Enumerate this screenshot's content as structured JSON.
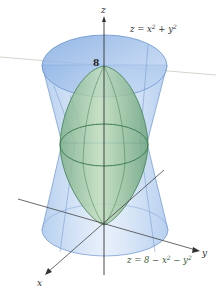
{
  "figure": {
    "colors": {
      "upper_surface_fill": "#a9c8ef",
      "upper_surface_stroke": "#5b86c5",
      "lower_surface_fill": "#8fbf8f",
      "lower_surface_stroke": "#3f7f52",
      "axis": "#333333",
      "background": "#ffffff"
    },
    "axes": {
      "x_label": "x",
      "y_label": "y",
      "z_label": "z"
    },
    "tick_label_8": "8",
    "surfaces": [
      {
        "name": "z = x² + y²",
        "label": "z = x² + y²",
        "label_prefix": "z = x",
        "label_sup1": "2",
        "label_mid": " + y",
        "label_sup2": "2",
        "color": "blue"
      },
      {
        "name": "z = 8 − x² − y²",
        "label": "z = 8 − x² − y²",
        "label_prefix": "z = 8 − x",
        "label_sup1": "2",
        "label_mid": " − y",
        "label_sup2": "2",
        "color": "green"
      }
    ]
  }
}
